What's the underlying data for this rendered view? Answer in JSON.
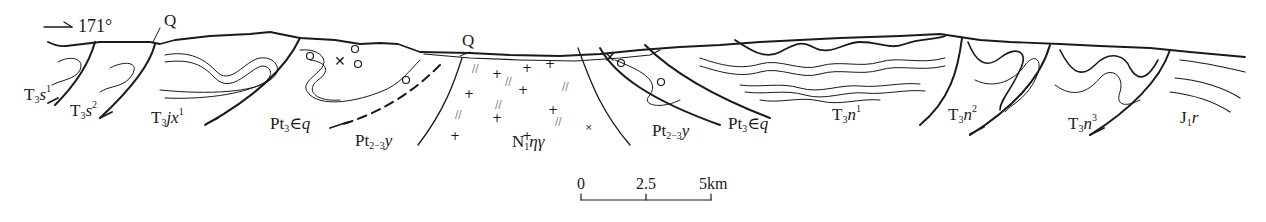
{
  "direction": {
    "arrow": "→",
    "azimuth": "171°"
  },
  "quaternary_labels": [
    "Q",
    "Q"
  ],
  "formations": [
    {
      "id": "T3s1",
      "base": "T",
      "sub": "3",
      "name": "s",
      "sup": "1"
    },
    {
      "id": "T3s2",
      "base": "T",
      "sub": "3",
      "name": "s",
      "sup": "2"
    },
    {
      "id": "T3jx1",
      "base": "T",
      "sub": "3",
      "name": "jx",
      "sup": "1"
    },
    {
      "id": "Pt3Eq-left",
      "base": "Pt",
      "sub": "3",
      "name": "∈q",
      "sup": ""
    },
    {
      "id": "Pt2-3y-left",
      "base": "Pt",
      "sub": "2−3",
      "name": "y",
      "sup": ""
    },
    {
      "id": "N1ηγ",
      "base": "N",
      "sub": "1",
      "name": "ηγ",
      "sup": ""
    },
    {
      "id": "Pt2-3y-right",
      "base": "Pt",
      "sub": "2−3",
      "name": "y",
      "sup": ""
    },
    {
      "id": "Pt3Eq-right",
      "base": "Pt",
      "sub": "3",
      "name": "∈q",
      "sup": ""
    },
    {
      "id": "T3n1",
      "base": "T",
      "sub": "3",
      "name": "n",
      "sup": "1"
    },
    {
      "id": "T3n2",
      "base": "T",
      "sub": "3",
      "name": "n",
      "sup": "2"
    },
    {
      "id": "T3n3",
      "base": "T",
      "sub": "3",
      "name": "n",
      "sup": "3"
    },
    {
      "id": "J1r",
      "base": "J",
      "sub": "1",
      "name": "r",
      "sup": ""
    }
  ],
  "scale_bar": {
    "ticks": [
      "0",
      "2.5",
      "5km"
    ],
    "unit": "km",
    "length_km": 5
  },
  "colors": {
    "line": "#1a1a1a",
    "background": "#ffffff",
    "fill_light": "#ffffff"
  }
}
